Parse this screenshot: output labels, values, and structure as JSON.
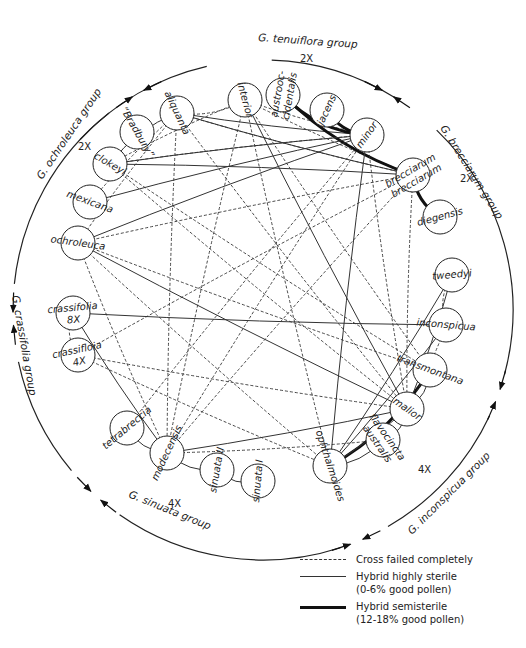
{
  "diagram": {
    "center": [
      263,
      310
    ],
    "radius": 250,
    "groups": [
      {
        "id": "tenuiflora",
        "label": "G. tenuiflora group",
        "ploidy": "2X",
        "label_xy": [
          258,
          41
        ],
        "label_rot": 4,
        "ploidy_xy": [
          300,
          62
        ]
      },
      {
        "id": "brecciarum",
        "label": "G. brecciarum group",
        "ploidy": "2X",
        "label_xy": [
          440,
          128
        ],
        "label_rot": 58,
        "ploidy_xy": [
          460,
          182
        ]
      },
      {
        "id": "inconspicua",
        "label": "G. inconspicua group",
        "ploidy": "4X",
        "label_xy": [
          412,
          535
        ],
        "label_rot": -45,
        "ploidy_xy": [
          418,
          473
        ]
      },
      {
        "id": "sinuata",
        "label": "G. sinuata group",
        "ploidy": "4X",
        "label_xy": [
          128,
          497
        ],
        "label_rot": 22,
        "ploidy_xy": [
          168,
          507
        ]
      },
      {
        "id": "crassifolia",
        "label": "G. crassifolia group",
        "ploidy": "",
        "label_xy": [
          12,
          296
        ],
        "label_rot": 80,
        "ploidy_xy": [
          0,
          0
        ]
      },
      {
        "id": "ochroleuca",
        "label": "G. ochroleuca group",
        "ploidy": "2X",
        "label_xy": [
          42,
          180
        ],
        "label_rot": -56,
        "ploidy_xy": [
          78,
          150
        ]
      }
    ],
    "nodes": [
      {
        "id": "interior",
        "label": "interior",
        "x": 245,
        "y": 100,
        "rot": 75
      },
      {
        "id": "austrooccidentalis",
        "label": "austrooc-",
        "label2": "cidentalis",
        "x": 283,
        "y": 95,
        "rot": -80
      },
      {
        "id": "jacens",
        "label": "jacens",
        "x": 327,
        "y": 110,
        "rot": -65
      },
      {
        "id": "minor",
        "label": "minor",
        "x": 367,
        "y": 135,
        "rot": -55
      },
      {
        "id": "brecciarum",
        "label": "brecciarum",
        "label2": "brecciarum",
        "x": 413,
        "y": 175,
        "rot": -30
      },
      {
        "id": "diegensis",
        "label": "diegensis",
        "x": 440,
        "y": 217,
        "rot": -15
      },
      {
        "id": "tweedyi",
        "label": "tweedyi",
        "x": 452,
        "y": 275,
        "rot": -5
      },
      {
        "id": "inconspicua",
        "label": "inconspicua",
        "x": 446,
        "y": 325,
        "rot": 5
      },
      {
        "id": "transmontana",
        "label": "transmontana",
        "x": 430,
        "y": 370,
        "rot": 20
      },
      {
        "id": "malior",
        "label": "malior",
        "x": 407,
        "y": 409,
        "rot": 35
      },
      {
        "id": "flavocincta",
        "label": "flavocincta",
        "label2": "australis",
        "x": 383,
        "y": 440,
        "rot": 55
      },
      {
        "id": "ophthalmoides",
        "label": "ophthalmoides",
        "x": 330,
        "y": 466,
        "rot": 72
      },
      {
        "id": "sinuata1",
        "label": "sinuata I",
        "x": 258,
        "y": 481,
        "rot": -85
      },
      {
        "id": "sinuata2",
        "label": "sinuata II",
        "x": 217,
        "y": 470,
        "rot": -80
      },
      {
        "id": "modecensis",
        "label": "modecensis",
        "x": 167,
        "y": 453,
        "rot": -65
      },
      {
        "id": "tetrabreccia",
        "label": "tetrabreccia",
        "x": 127,
        "y": 428,
        "rot": -40
      },
      {
        "id": "crassifolia4x",
        "label": "crassifloia",
        "label2": "4X",
        "x": 78,
        "y": 355,
        "rot": -12
      },
      {
        "id": "crassifolia8x",
        "label": "crassifolia",
        "label2": "8X",
        "x": 73,
        "y": 313,
        "rot": -5
      },
      {
        "id": "ochroleuca",
        "label": "ochroleuca",
        "x": 78,
        "y": 243,
        "rot": 8
      },
      {
        "id": "mexicana",
        "label": "mexicana",
        "x": 90,
        "y": 202,
        "rot": 20
      },
      {
        "id": "clokeyi",
        "label": "clokeyi",
        "x": 110,
        "y": 164,
        "rot": 30
      },
      {
        "id": "bradbury",
        "label": "“Bradbury”",
        "x": 137,
        "y": 132,
        "rot": 60
      },
      {
        "id": "aliquanta",
        "label": "aliquanta",
        "x": 177,
        "y": 113,
        "rot": 65
      }
    ],
    "edges": [
      {
        "a": "aliquanta",
        "b": "interior",
        "type": "failed"
      },
      {
        "a": "aliquanta",
        "b": "minor",
        "type": "sterile"
      },
      {
        "a": "aliquanta",
        "b": "brecciarum",
        "type": "sterile"
      },
      {
        "a": "aliquanta",
        "b": "brecciarum",
        "type": "failed"
      },
      {
        "a": "aliquanta",
        "b": "malior",
        "type": "failed"
      },
      {
        "a": "aliquanta",
        "b": "clokeyi",
        "type": "sterile"
      },
      {
        "a": "aliquanta",
        "b": "mexicana",
        "type": "failed"
      },
      {
        "a": "aliquanta",
        "b": "ochroleuca",
        "type": "failed"
      },
      {
        "a": "aliquanta",
        "b": "modecensis",
        "type": "failed"
      },
      {
        "a": "interior",
        "b": "clokeyi",
        "type": "failed"
      },
      {
        "a": "interior",
        "b": "minor",
        "type": "failed"
      },
      {
        "a": "interior",
        "b": "brecciarum",
        "type": "failed"
      },
      {
        "a": "interior",
        "b": "transmontana",
        "type": "failed"
      },
      {
        "a": "interior",
        "b": "ophthalmoides",
        "type": "failed"
      },
      {
        "a": "interior",
        "b": "malior",
        "type": "sterile"
      },
      {
        "a": "interior",
        "b": "modecensis",
        "type": "failed"
      },
      {
        "a": "austrooccidentalis",
        "b": "minor",
        "type": "semi"
      },
      {
        "a": "austrooccidentalis",
        "b": "brecciarum",
        "type": "semi"
      },
      {
        "a": "jacens",
        "b": "minor",
        "type": "semi"
      },
      {
        "a": "brecciarum",
        "b": "diegensis",
        "type": "semi"
      },
      {
        "a": "minor",
        "b": "clokeyi",
        "type": "sterile"
      },
      {
        "a": "minor",
        "b": "mexicana",
        "type": "sterile"
      },
      {
        "a": "minor",
        "b": "ochroleuca",
        "type": "sterile"
      },
      {
        "a": "minor",
        "b": "clokeyi",
        "type": "failed"
      },
      {
        "a": "minor",
        "b": "ophthalmoides",
        "type": "sterile"
      },
      {
        "a": "minor",
        "b": "malior",
        "type": "failed"
      },
      {
        "a": "minor",
        "b": "tetrabreccia",
        "type": "failed"
      },
      {
        "a": "minor",
        "b": "modecensis",
        "type": "failed"
      },
      {
        "a": "brecciarum",
        "b": "clokeyi",
        "type": "sterile"
      },
      {
        "a": "brecciarum",
        "b": "ochroleuca",
        "type": "failed"
      },
      {
        "a": "brecciarum",
        "b": "malior",
        "type": "failed"
      },
      {
        "a": "brecciarum",
        "b": "modecensis",
        "type": "failed"
      },
      {
        "a": "brecciarum",
        "b": "crassifolia4x",
        "type": "failed"
      },
      {
        "a": "clokeyi",
        "b": "malior",
        "type": "failed"
      },
      {
        "a": "clokeyi",
        "b": "transmontana",
        "type": "failed"
      },
      {
        "a": "ochroleuca",
        "b": "malior",
        "type": "sterile"
      },
      {
        "a": "ochroleuca",
        "b": "ophthalmoides",
        "type": "failed"
      },
      {
        "a": "ochroleuca",
        "b": "transmontana",
        "type": "failed"
      },
      {
        "a": "ochroleuca",
        "b": "modecensis",
        "type": "failed"
      },
      {
        "a": "crassifolia8x",
        "b": "inconspicua",
        "type": "sterile"
      },
      {
        "a": "crassifolia8x",
        "b": "modecensis",
        "type": "sterile"
      },
      {
        "a": "crassifolia8x",
        "b": "crassifolia4x",
        "type": "failed"
      },
      {
        "a": "crassifolia4x",
        "b": "malior",
        "type": "failed"
      },
      {
        "a": "crassifolia4x",
        "b": "ophthalmoides",
        "type": "failed"
      },
      {
        "a": "tetrabreccia",
        "b": "modecensis",
        "type": "sterile"
      },
      {
        "a": "modecensis",
        "b": "sinuata2",
        "type": "sterile"
      },
      {
        "a": "modecensis",
        "b": "malior",
        "type": "sterile"
      },
      {
        "a": "modecensis",
        "b": "flavocincta",
        "type": "failed"
      },
      {
        "a": "sinuata2",
        "b": "sinuata1",
        "type": "sterile"
      },
      {
        "a": "ophthalmoides",
        "b": "tweedyi",
        "type": "sterile"
      },
      {
        "a": "ophthalmoides",
        "b": "inconspicua",
        "type": "sterile"
      },
      {
        "a": "ophthalmoides",
        "b": "transmontana",
        "type": "semi"
      },
      {
        "a": "ophthalmoides",
        "b": "malior",
        "type": "sterile"
      },
      {
        "a": "ophthalmoides",
        "b": "flavocincta",
        "type": "sterile"
      },
      {
        "a": "malior",
        "b": "transmontana",
        "type": "sterile"
      },
      {
        "a": "malior",
        "b": "inconspicua",
        "type": "failed"
      },
      {
        "a": "malior",
        "b": "tweedyi",
        "type": "sterile"
      },
      {
        "a": "flavocincta",
        "b": "malior",
        "type": "sterile"
      },
      {
        "a": "tweedyi",
        "b": "inconspicua",
        "type": "failed"
      }
    ]
  },
  "legend": {
    "items": [
      {
        "type": "failed",
        "line1": "Cross failed completely",
        "line2": ""
      },
      {
        "type": "sterile",
        "line1": "Hybrid highly sterile",
        "line2": "(0-6% good pollen)"
      },
      {
        "type": "semi",
        "line1": "Hybrid semisterile",
        "line2": "(12-18% good pollen)"
      }
    ]
  }
}
